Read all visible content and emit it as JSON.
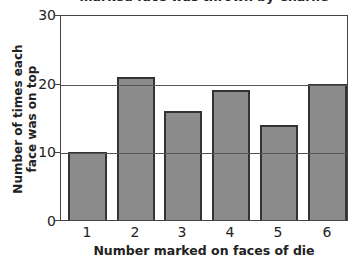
{
  "chart_data": {
    "type": "bar",
    "title": "marked face was thrown by Charlie",
    "xlabel": "Number marked on faces of die",
    "ylabel": "Number of times each face was on top",
    "categories": [
      "1",
      "2",
      "3",
      "4",
      "5",
      "6"
    ],
    "values": [
      10,
      21,
      16,
      19,
      14,
      20
    ],
    "ylim": [
      0,
      30
    ],
    "yticks": [
      "0",
      "10",
      "20",
      "30"
    ],
    "grid": true,
    "bar_color": "#8c8c8c",
    "legend": null
  },
  "labels": {
    "title": "marked face was thrown by Charlie",
    "ylabel_line1": "Number of times each",
    "ylabel_line2": "face was on top",
    "xlabel": "Number marked on faces of die",
    "yticks": [
      "0",
      "10",
      "20",
      "30"
    ],
    "xticks": [
      "1",
      "2",
      "3",
      "4",
      "5",
      "6"
    ]
  }
}
